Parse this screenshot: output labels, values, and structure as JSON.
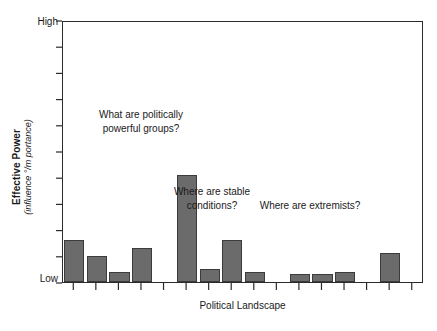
{
  "chart_data": {
    "type": "bar",
    "title": "",
    "xlabel": "Political Landscape",
    "ylabel": "Effective Power",
    "ylabel_sub": "(influence °/m portance)",
    "ytick_labels": [
      "High",
      "Low"
    ],
    "ylim": [
      0,
      100
    ],
    "grid": false,
    "legend": null,
    "bar_color": "#6b6b6b",
    "bar_edge_color": "#3b3b3b",
    "axis_color": "#2b2b2b",
    "n_slots": 16,
    "categories": [
      "1",
      "2",
      "3",
      "4",
      "5",
      "6",
      "7",
      "8",
      "9",
      "10",
      "11",
      "12",
      "13",
      "14",
      "15",
      "16"
    ],
    "values": [
      16,
      10,
      4,
      13,
      0,
      41,
      5,
      16,
      4,
      0,
      3,
      3,
      4,
      0,
      11,
      0
    ],
    "annotations": [
      {
        "text": "What are politically\npowerful groups?",
        "x": 0.33,
        "y": 0.6
      },
      {
        "text": "Where are stable\nconditions?",
        "x": 0.56,
        "y": 0.32
      },
      {
        "text": "Where are extremists?",
        "x": 0.8,
        "y": 0.27
      }
    ]
  },
  "axes": {
    "y_title_main": "Effective Power",
    "y_title_sub": "(influence °/m portance)",
    "y_tick_high": "High",
    "y_tick_low": "Low",
    "x_title": "Political Landscape"
  },
  "annotations": {
    "a0": "What are politically\npowerful groups?",
    "a1": "Where are stable\nconditions?",
    "a2": "Where are extremists?"
  }
}
